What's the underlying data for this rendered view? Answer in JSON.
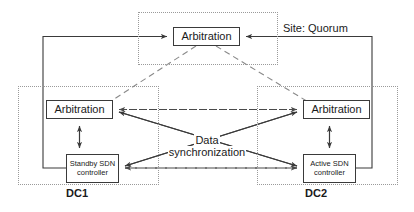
{
  "diagram": {
    "zones": {
      "quorum": {
        "site_label": "Site: Quorum"
      },
      "dc1": {
        "label": "DC1"
      },
      "dc2": {
        "label": "DC2"
      }
    },
    "nodes": {
      "arbitration_top": "Arbitration",
      "arbitration_left": "Arbitration",
      "arbitration_right": "Arbitration",
      "controller_left_line1": "Standby SDN",
      "controller_left_line2": "controller",
      "controller_right_line1": "Active SDN",
      "controller_right_line2": "controller"
    },
    "labels": {
      "sync_line1": "Data",
      "sync_line2": "synchronization"
    },
    "colors": {
      "node_border": "#3a3a3a",
      "zone_border": "#9a9a9a",
      "solid_link": "#3a3a3a",
      "dashed_link": "#4a4a4a",
      "text": "#1a1a1a",
      "background": "#ffffff"
    },
    "connections": [
      {
        "from": "controller_left",
        "to": "arbitration_top",
        "style": "solid",
        "arrow": "single",
        "route": "left-outer"
      },
      {
        "from": "controller_right",
        "to": "arbitration_top",
        "style": "solid",
        "arrow": "single",
        "route": "right-outer"
      },
      {
        "from": "arbitration_top",
        "to": "arbitration_left",
        "style": "dashed",
        "arrow": "none"
      },
      {
        "from": "arbitration_top",
        "to": "arbitration_right",
        "style": "dashed",
        "arrow": "none"
      },
      {
        "from": "arbitration_left",
        "to": "arbitration_right",
        "style": "dashed",
        "arrow": "double"
      },
      {
        "from": "controller_left",
        "to": "controller_right",
        "style": "dashed",
        "arrow": "double"
      },
      {
        "from": "arbitration_left",
        "to": "controller_left",
        "style": "solid",
        "arrow": "double"
      },
      {
        "from": "arbitration_right",
        "to": "controller_right",
        "style": "solid",
        "arrow": "double"
      },
      {
        "from": "arbitration_left",
        "to": "controller_right",
        "style": "solid",
        "arrow": "single"
      },
      {
        "from": "arbitration_right",
        "to": "controller_left",
        "style": "solid",
        "arrow": "single"
      }
    ]
  }
}
